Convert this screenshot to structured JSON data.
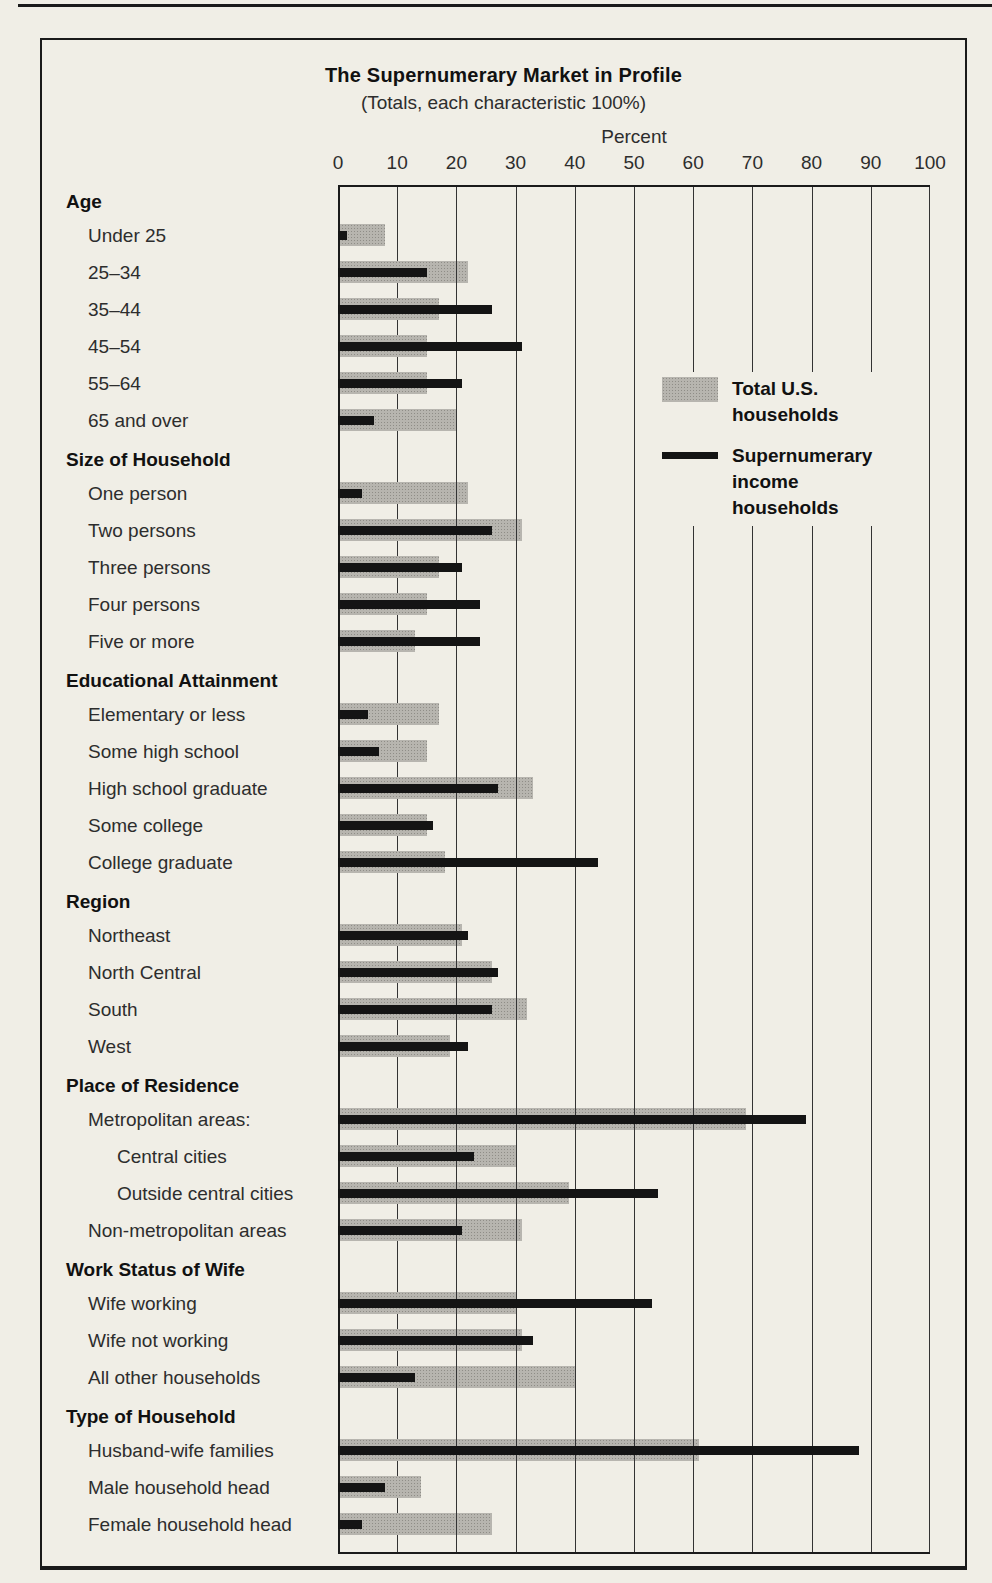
{
  "colors": {
    "paper": "#f0eee6",
    "bar_gray": "#b7b5af",
    "bar_gray_dot": "#8f8d87",
    "bar_black": "#141414",
    "grid_line": "#333333",
    "axis_line": "#1a1a1a",
    "text_dark": "#111111",
    "text_label": "#2d2d2d"
  },
  "chart_data": {
    "type": "bar",
    "orientation": "horizontal",
    "title": "The Supernumerary Market in Profile",
    "subtitle": "(Totals, each characteristic 100%)",
    "axis_label": "Percent",
    "x_ticks": [
      0,
      10,
      20,
      30,
      40,
      50,
      60,
      70,
      80,
      90,
      100
    ],
    "xlim": [
      0,
      100
    ],
    "grid": "on",
    "legend_position": "inside-top-right",
    "legend": [
      {
        "name": "Total U.S. households",
        "swatch": "gray-bar"
      },
      {
        "name": "Supernumerary income households",
        "swatch": "black-line"
      }
    ],
    "series_names": [
      "Total U.S. households",
      "Supernumerary income households"
    ],
    "sections": [
      {
        "header": "Age",
        "rows": [
          {
            "label": "Under 25",
            "total_us": 8,
            "supernumerary": 1.5
          },
          {
            "label": "25–34",
            "total_us": 22,
            "supernumerary": 15
          },
          {
            "label": "35–44",
            "total_us": 17,
            "supernumerary": 26
          },
          {
            "label": "45–54",
            "total_us": 15,
            "supernumerary": 31
          },
          {
            "label": "55–64",
            "total_us": 15,
            "supernumerary": 21
          },
          {
            "label": "65 and over",
            "total_us": 20,
            "supernumerary": 6
          }
        ]
      },
      {
        "header": "Size of Household",
        "rows": [
          {
            "label": "One person",
            "total_us": 22,
            "supernumerary": 4
          },
          {
            "label": "Two persons",
            "total_us": 31,
            "supernumerary": 26
          },
          {
            "label": "Three persons",
            "total_us": 17,
            "supernumerary": 21
          },
          {
            "label": "Four persons",
            "total_us": 15,
            "supernumerary": 24
          },
          {
            "label": "Five or more",
            "total_us": 13,
            "supernumerary": 24
          }
        ]
      },
      {
        "header": "Educational Attainment",
        "rows": [
          {
            "label": "Elementary or less",
            "total_us": 17,
            "supernumerary": 5
          },
          {
            "label": "Some high school",
            "total_us": 15,
            "supernumerary": 7
          },
          {
            "label": "High school graduate",
            "total_us": 33,
            "supernumerary": 27
          },
          {
            "label": "Some college",
            "total_us": 15,
            "supernumerary": 16
          },
          {
            "label": "College graduate",
            "total_us": 18,
            "supernumerary": 44
          }
        ]
      },
      {
        "header": "Region",
        "rows": [
          {
            "label": "Northeast",
            "total_us": 21,
            "supernumerary": 22
          },
          {
            "label": "North Central",
            "total_us": 26,
            "supernumerary": 27
          },
          {
            "label": "South",
            "total_us": 32,
            "supernumerary": 26
          },
          {
            "label": "West",
            "total_us": 19,
            "supernumerary": 22
          }
        ]
      },
      {
        "header": "Place of Residence",
        "rows": [
          {
            "label": "Metropolitan areas:",
            "total_us": 69,
            "supernumerary": 79
          },
          {
            "label": "Central cities",
            "indent": 1,
            "total_us": 30,
            "supernumerary": 23
          },
          {
            "label": "Outside central cities",
            "indent": 1,
            "total_us": 39,
            "supernumerary": 54
          },
          {
            "label": "Non-metropolitan areas",
            "total_us": 31,
            "supernumerary": 21
          }
        ]
      },
      {
        "header": "Work Status of Wife",
        "rows": [
          {
            "label": "Wife working",
            "total_us": 30,
            "supernumerary": 53
          },
          {
            "label": "Wife not working",
            "total_us": 31,
            "supernumerary": 33
          },
          {
            "label": "All other households",
            "total_us": 40,
            "supernumerary": 13
          }
        ]
      },
      {
        "header": "Type of Household",
        "rows": [
          {
            "label": "Husband-wife families",
            "total_us": 61,
            "supernumerary": 88
          },
          {
            "label": "Male household head",
            "total_us": 14,
            "supernumerary": 8
          },
          {
            "label": "Female household head",
            "total_us": 26,
            "supernumerary": 4
          }
        ]
      }
    ]
  }
}
